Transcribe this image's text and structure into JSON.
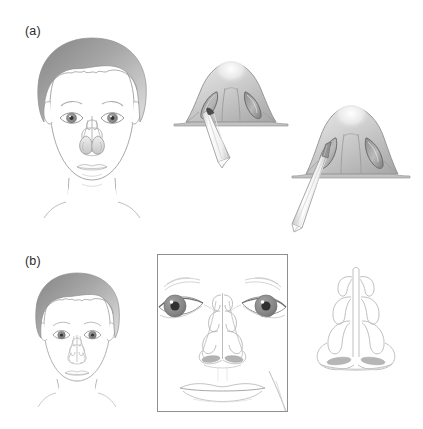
{
  "figure": {
    "background_color": "#ffffff",
    "width": 423,
    "height": 429,
    "panels": [
      {
        "id": "a",
        "label": "(a)",
        "label_x": 25,
        "label_y": 24,
        "items": [
          {
            "name": "frontal-face-with-nasal-polyps",
            "description": "Frontal view of a child's face with short gray hair; translucent overlay of nasal cavity showing bilateral nasal polyps / turbinates projected over the nose"
          },
          {
            "name": "nose-base-view-with-instrument-shallow",
            "description": "Worm's-eye (base) view of the nose showing both nostrils and columella, with a surgical cannula/trocar inserted a short distance into the patient's right nostril"
          },
          {
            "name": "nose-base-view-with-instrument-deep",
            "description": "Worm's-eye (base) view of the nose with the surgical cannula/trocar inserted more deeply and angled into the nostril"
          }
        ]
      },
      {
        "id": "b",
        "label": "(b)",
        "label_x": 25,
        "label_y": 254,
        "items": [
          {
            "name": "frontal-face-small",
            "description": "Smaller frontal view of the same child's face with gray hair and faint nasal anatomy overlay on the nose"
          },
          {
            "name": "facial-closeup-boxed",
            "description": "Boxed close-up crop of the mid-face: both eyes with gray irises and dark pupils, eyebrows, the nasal septum and turbinate structures drawn over the nose, nostrils and the upper and lower lips",
            "box": {
              "x": 157,
              "y": 254,
              "width": 131,
              "height": 158
            }
          },
          {
            "name": "nasal-septum-turbinate-diagram",
            "description": "Isolated line drawing of the nasal septum with bilateral superior, middle and inferior turbinates and two shaded nostril openings"
          }
        ]
      }
    ]
  },
  "colors": {
    "outline": "#9a9a9a",
    "outline_dark": "#6f6f6f",
    "hair_dark": "#8e8e8e",
    "hair_light": "#cfcfcf",
    "skin": "#ffffff",
    "nose_body_light": "#e8e8e8",
    "nose_body_mid": "#c9c9c9",
    "nose_body_dark": "#9d9d9d",
    "nostril_dark": "#6a6a6a",
    "iris": "#8a8a8a",
    "pupil": "#3a3a3a",
    "instrument_light": "#fbfbfb",
    "instrument_shadow": "#c4c4c4",
    "label_text": "#2b2b2b",
    "frame_border": "#8f8f8f"
  }
}
